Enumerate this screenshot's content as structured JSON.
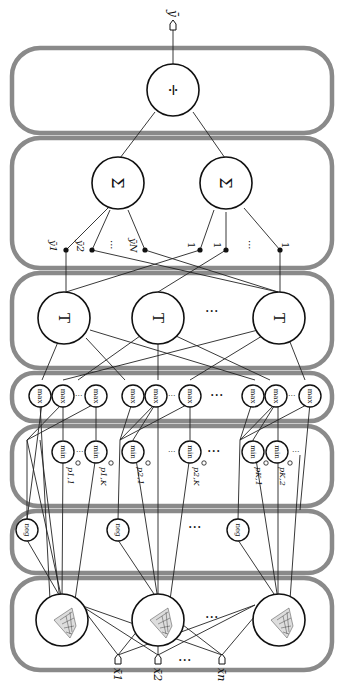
{
  "diagram": {
    "type": "fuzzy neural network (rotated 90 degrees)",
    "orientation": "rotated, input at bottom, output at top",
    "output": {
      "label": "ȳ"
    },
    "layers": [
      {
        "name": "division-layer",
        "node_symbol": "÷",
        "count": 1
      },
      {
        "name": "summation-layer",
        "node_symbol": "Σ",
        "count": 2,
        "weights_left": [
          "ȳ1",
          "ȳ2",
          "···",
          "ȳN"
        ],
        "weights_right": [
          "1",
          "1",
          "···",
          "1"
        ]
      },
      {
        "name": "t-norm-layer",
        "node_symbol": "T",
        "count_label": "···"
      },
      {
        "name": "max-layer",
        "node_symbol": "max"
      },
      {
        "name": "min-layer",
        "node_symbol": "min",
        "params": [
          "p1,1",
          "p1,K",
          "p2,1",
          "p2,K",
          "pK,1",
          "pK,2"
        ]
      },
      {
        "name": "neg-layer",
        "node_symbol": "neg"
      },
      {
        "name": "membership-layer",
        "node_symbol": "gaussian-surface"
      }
    ],
    "inputs": [
      "x̄1",
      "x̄2",
      "···",
      "x̄n"
    ],
    "ellipsis": "···"
  },
  "labels": {
    "out": "ȳ",
    "div": "÷",
    "sum": "Σ",
    "t": "T",
    "max": "max",
    "min": "min",
    "neg": "neg",
    "dots": "···",
    "y1": "ȳ1",
    "y2": "ȳ2",
    "yN": "ȳN",
    "one": "1",
    "p11": "p1,1",
    "p1K": "p1,K",
    "p21": "p2,1",
    "p2K": "p2,K",
    "pK1": "pK,1",
    "pK2": "pK,2",
    "x1": "x̄1",
    "x2": "x̄2",
    "xn": "x̄n"
  }
}
